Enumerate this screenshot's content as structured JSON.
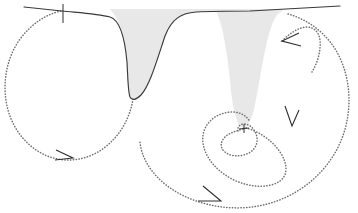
{
  "figure": {
    "domain": "diagram",
    "width": 358,
    "height": 213,
    "background_color": "#ffffff"
  },
  "colors": {
    "curve_stroke": "#3a3a3a",
    "shading_fill": "#e8e8e8",
    "trajectory_stroke": "#6e6e70",
    "arrow_stroke": "#2e2e2e",
    "tick_stroke": "#2e2e2e"
  },
  "potential_curve": {
    "name": "potential-energy-curve",
    "style": "solid",
    "stroke_width": 1.15,
    "baseline_y_left": 8,
    "baseline_y_right": 8,
    "path": "M 24 7 L 62 11 C 82 13 98 14 110 17 C 120 20 125 40 127 62 C 128 80 128 92 130 97 C 132 101 136 100 141 95 C 150 85 157 60 165 36 C 172 18 182 13 196 12 C 214 11 236 11 250 11 L 340 6",
    "wells": [
      {
        "label": "well-1",
        "center_x": 129,
        "bottom_y": 99,
        "depth": 91,
        "width": 62
      },
      {
        "label": "well-2",
        "center_x": 243,
        "bottom_y": 128,
        "depth": 120,
        "width": 52
      }
    ]
  },
  "shaded_region": {
    "name": "barrier-shading",
    "fill": "#e8e8e8",
    "description": "grey filled area between the inner flanks of the two potential wells",
    "path": "M 110 9 C 120 20 125 40 127 62 C 128 80 128 92 130 97 C 132 101 136 100 141 95 C 150 85 157 60 165 36 C 172 18 182 13 196 12 C 204 11.5 210 11 216 11 C 222 22 227 50 230 80 C 232 105 236 122 241 127 C 246 131 251 123 255 105 C 260 80 266 36 274 20 C 278 12 283 9.5 288 9 Z"
  },
  "trajectories": [
    {
      "name": "left-orbit",
      "style": "dotted",
      "description": "closed dotted loop under the first well",
      "path": "M 133 99 C 130 118 120 136 104 148 C 88 160 68 163 50 157 C 30 150 14 132 8 110 C 2 88 5 62 18 42 C 30 24 48 13 62 11"
    },
    {
      "name": "inner-spiral-small",
      "style": "dotted",
      "description": "small dotted loop circling the bottom of the second well",
      "path": "M 243 129 C 236 131 229 133 225 137 C 220 142 220 148 225 152 C 231 157 241 157 249 153 C 256 149 259 141 256 134 C 254 128 249 124 244 124 C 240 124 237 127 238 131"
    },
    {
      "name": "mid-spiral",
      "style": "dotted",
      "description": "medium dotted spiral loop around the second well",
      "path": "M 246 128 C 258 131 272 140 280 152 C 288 164 288 175 280 181 C 270 188 253 188 236 181 C 218 173 205 158 203 143 C 201 128 211 116 225 113 C 236 110 246 114 250 122"
    },
    {
      "name": "outer-spiral",
      "style": "dotted",
      "description": "large outer dotted spiral sweeping from upper right around to the lower left",
      "path": "M 288 14 C 310 20 330 36 340 58 C 352 84 352 116 340 143 C 328 170 304 192 274 202 C 244 212 210 209 182 195 C 158 183 142 163 140 142"
    },
    {
      "name": "entry-arc-upper-right",
      "style": "dotted",
      "description": "short dotted arc entering from the top right toward the second well flank",
      "path": "M 282 41 C 290 33 298 28 306 27 C 314 27 319 32 320 40 C 321 50 318 62 312 72"
    }
  ],
  "arrow_heads": [
    {
      "name": "arrow-left-orbit",
      "tip_x": 72,
      "tip_y": 158,
      "direction": "right",
      "angle_deg": 10
    },
    {
      "name": "arrow-upper-right-inflow",
      "tip_x": 282,
      "tip_y": 41,
      "direction": "left-down",
      "angle_deg": 200
    },
    {
      "name": "arrow-mid-spiral",
      "tip_x": 292,
      "tip_y": 126,
      "direction": "down",
      "angle_deg": 78
    },
    {
      "name": "arrow-outer-spiral",
      "tip_x": 220,
      "tip_y": 201,
      "direction": "right-down",
      "angle_deg": 20
    }
  ],
  "tick_marks": [
    {
      "name": "tick-left-curve",
      "x": 63,
      "y_top": 4,
      "y_bottom": 23,
      "orientation": "vertical"
    },
    {
      "name": "tick-well-bottom",
      "x": 244,
      "y": 128,
      "orientation": "cross",
      "size": 7
    }
  ]
}
